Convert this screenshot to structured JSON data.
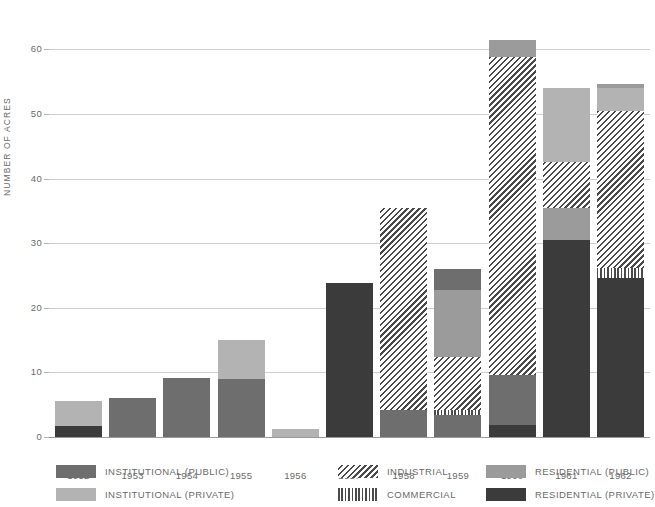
{
  "chart_data": {
    "type": "bar",
    "title": "",
    "xlabel": "",
    "ylabel": "NUMBER OF ACRES",
    "ylim": [
      0,
      63
    ],
    "yticks": [
      0,
      10,
      20,
      30,
      40,
      50,
      60
    ],
    "grid": true,
    "stacked": true,
    "legend_position": "bottom",
    "categories": [
      "1952",
      "1953",
      "1954",
      "1955",
      "1956",
      "1957",
      "1958",
      "1959",
      "1960",
      "1961",
      "1962"
    ],
    "series": [
      {
        "name": "INSTITUTIONAL (PUBLIC)",
        "key": "inst-pub",
        "color": "#6e6e6e",
        "pattern": "solid",
        "values": [
          0,
          6.0,
          9.2,
          9.0,
          0,
          0,
          4.2,
          3.4,
          7.7,
          0,
          0
        ]
      },
      {
        "name": "INSTITUTIONAL (PRIVATE)",
        "key": "inst-priv",
        "color": "#b3b3b3",
        "pattern": "solid",
        "values": [
          3.8,
          0,
          0,
          6.0,
          1.2,
          0,
          0,
          0,
          0,
          0,
          0
        ]
      },
      {
        "name": "INDUSTRIAL",
        "key": "industrial",
        "color": "#4a4a4a",
        "pattern": "diagonal-hatch",
        "values": [
          0,
          0,
          0,
          0,
          0,
          0,
          31.3,
          8.2,
          49.2,
          7.1,
          24.3
        ]
      },
      {
        "name": "COMMERCIAL",
        "key": "commercial",
        "color": "#4a4a4a",
        "pattern": "vertical-hatch",
        "values": [
          0,
          0,
          0,
          0,
          0,
          0,
          0,
          0.8,
          0,
          0,
          1.6
        ]
      },
      {
        "name": "RESIDENTIAL (PUBLIC)",
        "key": "res-pub",
        "color": "#9b9b9b",
        "pattern": "solid",
        "values": [
          0,
          0,
          0,
          0,
          0,
          0,
          0,
          13.6,
          4.0,
          23.5,
          4.0
        ]
      },
      {
        "name": "RESIDENTIAL (PRIVATE)",
        "key": "res-priv",
        "color": "#3b3b3b",
        "pattern": "solid",
        "values": [
          1.7,
          0,
          0,
          0,
          0,
          23.8,
          0,
          0,
          1.9,
          30.5,
          24.6
        ]
      }
    ],
    "totals": [
      5.5,
      6.0,
      9.2,
      15.0,
      1.2,
      23.8,
      35.5,
      26.0,
      61.5,
      54.0,
      54.5
    ],
    "stacks": [
      {
        "category": "1952",
        "segments": [
          {
            "key": "res-priv",
            "from": 0,
            "to": 1.7
          },
          {
            "key": "inst-priv",
            "from": 1.7,
            "to": 5.5
          }
        ]
      },
      {
        "category": "1953",
        "segments": [
          {
            "key": "inst-pub",
            "from": 0,
            "to": 6.0
          }
        ]
      },
      {
        "category": "1954",
        "segments": [
          {
            "key": "inst-pub",
            "from": 0,
            "to": 9.2
          }
        ]
      },
      {
        "category": "1955",
        "segments": [
          {
            "key": "inst-pub",
            "from": 0,
            "to": 9.0
          },
          {
            "key": "inst-priv",
            "from": 9.0,
            "to": 15.0
          }
        ]
      },
      {
        "category": "1956",
        "segments": [
          {
            "key": "inst-priv",
            "from": 0,
            "to": 1.2
          }
        ]
      },
      {
        "category": "1957",
        "segments": [
          {
            "key": "res-priv",
            "from": 0,
            "to": 23.8
          }
        ]
      },
      {
        "category": "1958",
        "segments": [
          {
            "key": "inst-pub",
            "from": 0,
            "to": 4.2
          },
          {
            "key": "industrial",
            "from": 4.2,
            "to": 35.5
          }
        ]
      },
      {
        "category": "1959",
        "segments": [
          {
            "key": "inst-pub",
            "from": 0,
            "to": 3.4
          },
          {
            "key": "commercial",
            "from": 3.4,
            "to": 4.2
          },
          {
            "key": "industrial",
            "from": 4.2,
            "to": 12.4
          },
          {
            "key": "res-pub",
            "from": 12.4,
            "to": 22.8
          },
          {
            "key": "inst-pub",
            "from": 22.8,
            "to": 26.0
          }
        ]
      },
      {
        "category": "1960",
        "segments": [
          {
            "key": "res-priv",
            "from": 0,
            "to": 1.9
          },
          {
            "key": "inst-pub",
            "from": 1.9,
            "to": 9.6
          },
          {
            "key": "industrial",
            "from": 9.6,
            "to": 58.8
          },
          {
            "key": "res-pub",
            "from": 58.8,
            "to": 61.5
          }
        ]
      },
      {
        "category": "1961",
        "segments": [
          {
            "key": "res-priv",
            "from": 0,
            "to": 30.5
          },
          {
            "key": "res-pub",
            "from": 30.5,
            "to": 35.5
          },
          {
            "key": "industrial",
            "from": 35.5,
            "to": 42.6
          },
          {
            "key": "inst-priv",
            "from": 42.6,
            "to": 54.0
          }
        ]
      },
      {
        "category": "1962",
        "segments": [
          {
            "key": "res-priv",
            "from": 0,
            "to": 24.6
          },
          {
            "key": "commercial",
            "from": 24.6,
            "to": 26.2
          },
          {
            "key": "industrial",
            "from": 26.2,
            "to": 50.5
          },
          {
            "key": "inst-priv",
            "from": 50.5,
            "to": 54.0
          },
          {
            "key": "res-pub",
            "from": 54.0,
            "to": 54.6
          }
        ]
      }
    ]
  },
  "legend": {
    "columns": [
      [
        {
          "label": "INSTITUTIONAL  (PUBLIC)",
          "key": "inst-pub"
        },
        {
          "label": "INSTITUTIONAL  (PRIVATE)",
          "key": "inst-priv"
        }
      ],
      [
        {
          "label": "INDUSTRIAL",
          "key": "industrial"
        },
        {
          "label": "COMMERCIAL",
          "key": "commercial"
        }
      ],
      [
        {
          "label": "RESIDENTIAL  (PUBLIC)",
          "key": "res-pub"
        },
        {
          "label": "RESIDENTIAL  (PRIVATE)",
          "key": "res-priv"
        }
      ]
    ]
  }
}
